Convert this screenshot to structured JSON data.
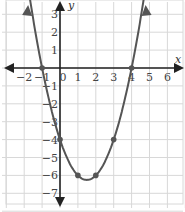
{
  "chart_data": {
    "type": "line",
    "title": "",
    "xlabel": "x",
    "ylabel": "y",
    "function": "y = x^2 - 3x - 4",
    "xlim": [
      -3,
      7
    ],
    "ylim": [
      -8,
      4
    ],
    "grid": true,
    "x_ticks": [
      "−2",
      "−1",
      "0",
      "1",
      "2",
      "3",
      "4",
      "5",
      "6"
    ],
    "y_ticks": [
      "3",
      "2",
      "1",
      "−1",
      "−2",
      "−3",
      "−4",
      "−5",
      "−6",
      "−7"
    ],
    "points": [
      {
        "x": -1,
        "y": 0
      },
      {
        "x": 0,
        "y": -4
      },
      {
        "x": 1,
        "y": -6
      },
      {
        "x": 2,
        "y": -6
      },
      {
        "x": 3,
        "y": -4
      },
      {
        "x": 4,
        "y": 0
      }
    ],
    "vertex": {
      "x": 1.5,
      "y": -6.25
    }
  },
  "colors": {
    "grid": "#d8d8d8",
    "axis": "#222222",
    "curve": "#555555"
  }
}
